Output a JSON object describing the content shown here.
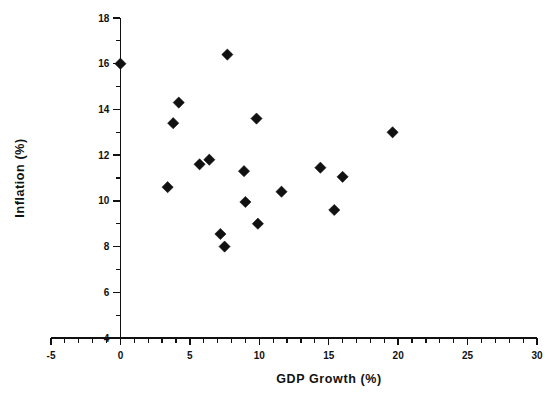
{
  "chart_data": {
    "type": "scatter",
    "title": "",
    "xlabel": "GDP Growth  (%)",
    "ylabel": "Inflation  (%)",
    "xlim": [
      -5,
      30
    ],
    "ylim": [
      4,
      18
    ],
    "x_major_ticks": [
      -5,
      0,
      5,
      10,
      15,
      20,
      25,
      30
    ],
    "x_tick_labels": [
      "-5",
      "0",
      "5",
      "10",
      "15",
      "20",
      "25",
      "30"
    ],
    "x_minor_step": 1,
    "y_major_ticks": [
      4,
      6,
      8,
      10,
      12,
      14,
      16,
      18
    ],
    "y_tick_labels": [
      "4",
      "6",
      "8",
      "10",
      "12",
      "14",
      "16",
      "18"
    ],
    "y_minor_step": 1,
    "grid": false,
    "legend": null,
    "marker": "diamond",
    "marker_color": "#111111",
    "points": [
      {
        "x": 0.0,
        "y": 16.0
      },
      {
        "x": 7.7,
        "y": 16.4
      },
      {
        "x": 4.2,
        "y": 14.3
      },
      {
        "x": 3.8,
        "y": 13.4
      },
      {
        "x": 9.8,
        "y": 13.6
      },
      {
        "x": 19.6,
        "y": 13.0
      },
      {
        "x": 6.4,
        "y": 11.8
      },
      {
        "x": 5.7,
        "y": 11.6
      },
      {
        "x": 8.9,
        "y": 11.3
      },
      {
        "x": 14.4,
        "y": 11.45
      },
      {
        "x": 16.0,
        "y": 11.05
      },
      {
        "x": 3.4,
        "y": 10.6
      },
      {
        "x": 11.6,
        "y": 10.4
      },
      {
        "x": 9.0,
        "y": 9.95
      },
      {
        "x": 15.4,
        "y": 9.6
      },
      {
        "x": 9.9,
        "y": 9.0
      },
      {
        "x": 7.2,
        "y": 8.55
      },
      {
        "x": 7.5,
        "y": 8.0
      }
    ]
  },
  "geometry": {
    "width": 554,
    "height": 409,
    "plot_left": 120.4,
    "plot_right": 537,
    "plot_top": 18,
    "plot_bottom": 338,
    "axis_x_left": 51,
    "marker_size": 5.6
  }
}
